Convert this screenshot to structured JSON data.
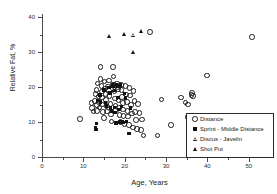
{
  "chart_data": {
    "type": "scatter",
    "title": "",
    "xlabel": "Age, Years",
    "ylabel": "Relative Fat, %",
    "xlim": [
      0,
      52
    ],
    "ylim": [
      0,
      41
    ],
    "grid": false,
    "legend_position": "bottom-right",
    "xticks": [
      0,
      10,
      20,
      30,
      40,
      50
    ],
    "xticks_minor": [
      5,
      15,
      25,
      35,
      45
    ],
    "yticks": [
      0,
      10,
      20,
      30,
      40
    ],
    "yticks_minor": [
      5,
      15,
      25,
      35
    ],
    "series": [
      {
        "name": "Distance",
        "marker": "circle-open",
        "points": [
          [
            9.0,
            11.0
          ],
          [
            11.8,
            15.7
          ],
          [
            12.0,
            14.2
          ],
          [
            12.3,
            13.2
          ],
          [
            12.6,
            16.3
          ],
          [
            12.8,
            18.3
          ],
          [
            13.0,
            19.4
          ],
          [
            13.1,
            15.0
          ],
          [
            13.2,
            13.4
          ],
          [
            13.3,
            21.3
          ],
          [
            13.5,
            17.5
          ],
          [
            13.6,
            16.0
          ],
          [
            13.8,
            14.4
          ],
          [
            14.0,
            26.0
          ],
          [
            14.0,
            22.5
          ],
          [
            14.2,
            20.6
          ],
          [
            14.3,
            18.9
          ],
          [
            14.4,
            17.2
          ],
          [
            14.5,
            15.2
          ],
          [
            14.6,
            13.0
          ],
          [
            14.8,
            11.4
          ],
          [
            15.0,
            21.8
          ],
          [
            15.1,
            19.8
          ],
          [
            15.2,
            18.2
          ],
          [
            15.4,
            16.6
          ],
          [
            15.5,
            14.8
          ],
          [
            15.6,
            13.2
          ],
          [
            15.8,
            20.4
          ],
          [
            16.0,
            22.1
          ],
          [
            16.1,
            19.2
          ],
          [
            16.2,
            17.6
          ],
          [
            16.4,
            15.4
          ],
          [
            16.5,
            12.4
          ],
          [
            16.7,
            10.4
          ],
          [
            16.9,
            21.0
          ],
          [
            17.0,
            26.0
          ],
          [
            17.1,
            23.2
          ],
          [
            17.2,
            20.8
          ],
          [
            17.4,
            19.0
          ],
          [
            17.5,
            17.0
          ],
          [
            17.6,
            14.9
          ],
          [
            17.8,
            13.6
          ],
          [
            18.0,
            21.2
          ],
          [
            18.1,
            20.3
          ],
          [
            18.2,
            19.6
          ],
          [
            18.4,
            16.4
          ],
          [
            18.5,
            14.2
          ],
          [
            18.6,
            12.2
          ],
          [
            18.8,
            10.2
          ],
          [
            19.0,
            20.9
          ],
          [
            19.1,
            19.3
          ],
          [
            19.2,
            17.4
          ],
          [
            19.4,
            15.6
          ],
          [
            19.5,
            13.8
          ],
          [
            19.6,
            12.0
          ],
          [
            19.8,
            9.6
          ],
          [
            20.0,
            20.6
          ],
          [
            20.2,
            18.1
          ],
          [
            20.4,
            16.0
          ],
          [
            20.5,
            13.4
          ],
          [
            20.7,
            11.8
          ],
          [
            20.9,
            9.4
          ],
          [
            21.0,
            20.0
          ],
          [
            21.2,
            17.8
          ],
          [
            21.4,
            15.0
          ],
          [
            21.6,
            12.6
          ],
          [
            21.8,
            8.6
          ],
          [
            22.0,
            19.1
          ],
          [
            22.2,
            16.2
          ],
          [
            22.4,
            13.0
          ],
          [
            22.6,
            10.8
          ],
          [
            22.8,
            8.2
          ],
          [
            23.0,
            15.4
          ],
          [
            23.4,
            12.8
          ],
          [
            23.8,
            8.0
          ],
          [
            24.0,
            10.9
          ],
          [
            24.4,
            6.3
          ],
          [
            26.0,
            36.0
          ],
          [
            27.8,
            6.3
          ],
          [
            28.8,
            16.7
          ],
          [
            31.0,
            9.4
          ],
          [
            33.4,
            17.2
          ],
          [
            34.6,
            15.8
          ],
          [
            35.0,
            11.6
          ],
          [
            35.2,
            15.2
          ],
          [
            36.0,
            18.0
          ],
          [
            36.2,
            18.6
          ],
          [
            36.4,
            17.7
          ],
          [
            39.8,
            23.5
          ],
          [
            50.6,
            34.5
          ]
        ]
      },
      {
        "name": "Sprint - Middle Distance",
        "marker": "square-filled",
        "points": [
          [
            13.0,
            8.3
          ],
          [
            13.1,
            7.8
          ],
          [
            13.2,
            9.6
          ],
          [
            13.4,
            16.2
          ],
          [
            14.0,
            17.8
          ],
          [
            14.2,
            15.8
          ],
          [
            15.0,
            19.2
          ],
          [
            15.4,
            15.6
          ],
          [
            15.6,
            14.6
          ],
          [
            16.2,
            20.0
          ],
          [
            16.4,
            18.4
          ],
          [
            16.6,
            14.0
          ],
          [
            16.8,
            13.2
          ],
          [
            17.0,
            20.7
          ],
          [
            17.2,
            20.2
          ],
          [
            17.4,
            19.0
          ],
          [
            17.5,
            14.2
          ],
          [
            17.7,
            12.8
          ],
          [
            17.9,
            9.8
          ],
          [
            18.0,
            20.8
          ],
          [
            18.2,
            20.4
          ],
          [
            18.4,
            17.1
          ],
          [
            18.6,
            13.6
          ],
          [
            18.8,
            10.0
          ],
          [
            19.0,
            20.6
          ],
          [
            19.2,
            14.4
          ],
          [
            19.4,
            10.2
          ],
          [
            19.6,
            9.9
          ],
          [
            20.0,
            18.2
          ],
          [
            20.2,
            16.9
          ],
          [
            20.4,
            10.1
          ],
          [
            21.0,
            6.8
          ],
          [
            21.4,
            14.1
          ]
        ]
      },
      {
        "name": "Discus - Javelin",
        "marker": "triangle-open",
        "points": [
          [
            17.2,
            19.5
          ],
          [
            22.2,
            35.0
          ]
        ]
      },
      {
        "name": "Shot Put",
        "marker": "triangle-filled",
        "points": [
          [
            16.4,
            34.8
          ],
          [
            20.0,
            35.2
          ],
          [
            22.0,
            30.1
          ],
          [
            24.0,
            36.0
          ]
        ]
      }
    ]
  },
  "legend": {
    "entries": [
      {
        "label": "Distance",
        "marker": "circle-open"
      },
      {
        "label": "Sprint - Middle Distance",
        "marker": "square-filled"
      },
      {
        "label": "Discus - Javelin",
        "marker": "triangle-open"
      },
      {
        "label": "Shot Put",
        "marker": "triangle-filled"
      }
    ]
  }
}
